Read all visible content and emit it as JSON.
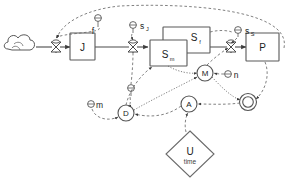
{
  "diagram": {
    "type": "system-dynamics-stock-flow",
    "canvas": {
      "width": 296,
      "height": 183,
      "background": "#ffffff"
    },
    "colors": {
      "stroke_solid": "#4a4a4a",
      "stroke_dashed": "#6a6a6a",
      "box_fill": "#ffffff",
      "text": "#1c1c1c"
    },
    "stocks": [
      {
        "id": "J",
        "label": "J",
        "x": 75,
        "y": 42
      },
      {
        "id": "Sm",
        "label": "S",
        "sub": "m",
        "x": 160,
        "y": 57
      },
      {
        "id": "Sf",
        "label": "S",
        "sub": "f",
        "x": 186,
        "y": 40
      },
      {
        "id": "P",
        "label": "P",
        "x": 262,
        "y": 48
      }
    ],
    "converters": [
      {
        "id": "M",
        "label": "M",
        "x": 205,
        "y": 73
      },
      {
        "id": "D",
        "label": "D",
        "x": 126,
        "y": 113
      },
      {
        "id": "A",
        "label": "A",
        "x": 189,
        "y": 104
      },
      {
        "id": "O",
        "label": "O",
        "x": 248,
        "y": 102,
        "double_ring": true
      }
    ],
    "parameters": [
      {
        "id": "f",
        "label": "f",
        "x": 98,
        "y": 20
      },
      {
        "id": "sJ",
        "label": "s",
        "sub": "J",
        "x": 133,
        "y": 26
      },
      {
        "id": "sS",
        "label": "s",
        "sub": "S",
        "x": 238,
        "y": 31
      },
      {
        "id": "n",
        "label": "n",
        "x": 231,
        "y": 74
      },
      {
        "id": "m",
        "label": "m",
        "x": 95,
        "y": 105
      },
      {
        "id": "T",
        "label": "",
        "x": 131,
        "y": 88
      }
    ],
    "diamonds": [
      {
        "id": "U",
        "label": "U",
        "sublabel": "time",
        "x": 190,
        "y": 154
      }
    ],
    "sources": [
      {
        "id": "cloud-source",
        "label": "",
        "x": 22,
        "y": 47
      }
    ],
    "valves": [
      {
        "id": "valve-inflow-J",
        "x": 56,
        "y": 47
      },
      {
        "id": "valve-J-to-Sm",
        "x": 133,
        "y": 47
      },
      {
        "id": "valve-Sm-to-P",
        "x": 231,
        "y": 47
      }
    ],
    "flows": [
      {
        "from": "cloud-source",
        "to": "J",
        "via": "valve-inflow-J"
      },
      {
        "from": "J",
        "to": "Sm",
        "via": "valve-J-to-Sm"
      },
      {
        "from": "Sm",
        "to": "P",
        "via": "valve-Sm-to-P"
      }
    ],
    "influences": [
      {
        "from": "f",
        "to": "valve-inflow-J"
      },
      {
        "from": "P",
        "to": "valve-inflow-J",
        "style": "long-arc"
      },
      {
        "from": "sJ",
        "to": "valve-J-to-Sm"
      },
      {
        "from": "sS",
        "to": "valve-Sm-to-P"
      },
      {
        "from": "M",
        "to": "valve-Sm-to-P"
      },
      {
        "from": "n",
        "to": "M"
      },
      {
        "from": "Sm",
        "to": "M"
      },
      {
        "from": "m",
        "to": "D"
      },
      {
        "from": "T",
        "to": "D"
      },
      {
        "from": "A",
        "to": "D"
      },
      {
        "from": "D",
        "to": "Sm"
      },
      {
        "from": "U",
        "to": "A"
      },
      {
        "from": "O",
        "to": "A"
      },
      {
        "from": "M",
        "to": "O"
      },
      {
        "from": "P",
        "to": "O"
      }
    ]
  }
}
